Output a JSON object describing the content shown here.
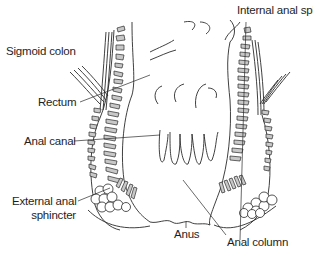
{
  "diagram": {
    "colors": {
      "background": "#ffffff",
      "outline": "#2a2a2a",
      "muscle_fill": "#c8c8c8",
      "label_text": "#1e1e1e"
    },
    "labels": {
      "internal_anal_sphincter": "Internal anal sphincter",
      "sigmoid_colon": "Sigmoid colon",
      "rectum": "Rectum",
      "anal_canal": "Anal canal",
      "external_anal_sphincter_line1": "External anal",
      "external_anal_sphincter_line2": "sphincter",
      "anus": "Anus",
      "anal_column": "Anal column"
    }
  }
}
